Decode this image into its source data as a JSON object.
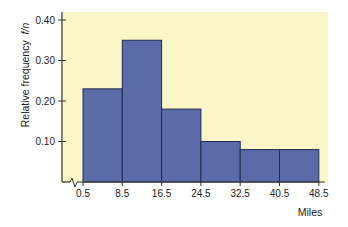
{
  "chart_data": {
    "type": "bar",
    "subtype": "histogram",
    "title": "",
    "xlabel": "Miles",
    "ylabel": "Relative frequency",
    "ylabel_italic": "f/n",
    "bin_edges": [
      0.5,
      8.5,
      16.5,
      24.5,
      32.5,
      40.5,
      48.5
    ],
    "x_tick_labels": [
      "0.5",
      "8.5",
      "16.5",
      "24.5",
      "32.5",
      "40.5",
      "48.5"
    ],
    "categories": [
      "0.5-8.5",
      "8.5-16.5",
      "16.5-24.5",
      "24.5-32.5",
      "32.5-40.5",
      "40.5-48.5"
    ],
    "values": [
      0.23,
      0.35,
      0.18,
      0.1,
      0.08,
      0.08
    ],
    "y_ticks": [
      0.1,
      0.2,
      0.3,
      0.4
    ],
    "y_tick_labels": [
      "0.10",
      "0.20",
      "0.30",
      "0.40"
    ],
    "ylim": [
      0,
      0.4
    ],
    "x_axis_break": true,
    "grid": false,
    "legend": null
  },
  "colors": {
    "plot_background": "#fbf6c8",
    "bar_fill": "#5b6ba8",
    "bar_edge": "#1f2a55",
    "axis": "#333333"
  }
}
